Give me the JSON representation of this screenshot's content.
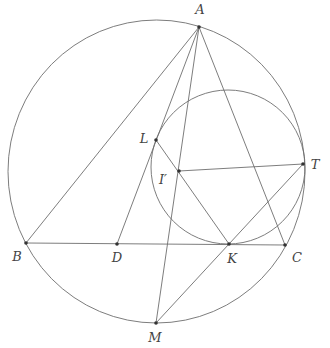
{
  "diagram": {
    "type": "geometry",
    "circumcircle": {
      "cx": 156.5,
      "cy": 171.5,
      "rx": 148.5,
      "ry": 151.5
    },
    "mixtilinear_circle": {
      "cx": 228,
      "cy": 167,
      "r": 77
    },
    "points": {
      "A": {
        "label": "A",
        "x": 199,
        "y": 27,
        "lx": 200,
        "ly": 14
      },
      "B": {
        "label": "B",
        "x": 26,
        "y": 243,
        "lx": 17,
        "ly": 261
      },
      "C": {
        "label": "C",
        "x": 285,
        "y": 245,
        "lx": 297,
        "ly": 262
      },
      "D": {
        "label": "D",
        "x": 117,
        "y": 244,
        "lx": 117,
        "ly": 262
      },
      "K": {
        "label": "K",
        "x": 229,
        "y": 244,
        "lx": 232,
        "ly": 263
      },
      "L": {
        "label": "L",
        "x": 156,
        "y": 140,
        "lx": 144,
        "ly": 143
      },
      "I": {
        "label": "I′",
        "x": 179,
        "y": 171,
        "lx": 163,
        "ly": 184
      },
      "T": {
        "label": "T",
        "x": 303,
        "y": 164,
        "lx": 315,
        "ly": 169
      },
      "M": {
        "label": "M",
        "x": 156,
        "y": 323,
        "lx": 155,
        "ly": 342
      }
    },
    "segments": [
      [
        "A",
        "B"
      ],
      [
        "A",
        "C"
      ],
      [
        "B",
        "C"
      ],
      [
        "A",
        "M"
      ],
      [
        "A",
        "D"
      ],
      [
        "L",
        "K"
      ],
      [
        "I",
        "T"
      ],
      [
        "K",
        "T"
      ],
      [
        "K",
        "M"
      ]
    ]
  }
}
